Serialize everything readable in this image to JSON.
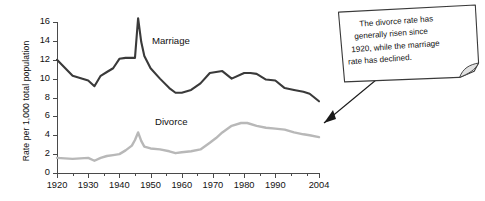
{
  "chart_data": {
    "type": "line",
    "title": "",
    "xlabel": "",
    "ylabel": "Rate per 1,000 total population",
    "xlim": [
      1920,
      2004
    ],
    "ylim": [
      0,
      16
    ],
    "grid": false,
    "legend": "inline-series-labels",
    "y_ticks": [
      0,
      2,
      4,
      6,
      8,
      10,
      12,
      14,
      16
    ],
    "y_tick_labels": [
      "0",
      "2",
      "4",
      "6",
      "8",
      "10",
      "12",
      "14",
      "16"
    ],
    "x_tick_labels": [
      "1920",
      "1930",
      "1940",
      "1950",
      "1960",
      "1970",
      "1980",
      "1990",
      "2004"
    ],
    "x_major_ticks": [
      1920,
      1930,
      1940,
      1950,
      1960,
      1970,
      1980,
      1990,
      2004
    ],
    "x_minor_ticks": [
      1925,
      1935,
      1945,
      1955,
      1965,
      1975,
      1985,
      1995,
      2000
    ],
    "series": [
      {
        "name": "Marriage",
        "color": "#3a3a3a",
        "label_text": "Marriage",
        "x": [
          1920,
          1925,
          1930,
          1932,
          1934,
          1936,
          1938,
          1940,
          1942,
          1944,
          1945,
          1946,
          1947,
          1948,
          1950,
          1953,
          1956,
          1958,
          1960,
          1963,
          1966,
          1969,
          1971,
          1973,
          1976,
          1980,
          1982,
          1984,
          1987,
          1990,
          1993,
          1996,
          1999,
          2001,
          2004
        ],
        "values": [
          12.0,
          10.3,
          9.8,
          9.2,
          10.3,
          10.7,
          11.1,
          12.1,
          12.2,
          12.2,
          12.2,
          16.4,
          13.9,
          12.4,
          11.1,
          10.0,
          9.0,
          8.5,
          8.5,
          8.8,
          9.5,
          10.6,
          10.7,
          10.8,
          10.0,
          10.6,
          10.6,
          10.5,
          9.9,
          9.8,
          9.0,
          8.8,
          8.6,
          8.4,
          7.6
        ]
      },
      {
        "name": "Divorce",
        "color": "#b8b8b8",
        "label_text": "Divorce",
        "x": [
          1920,
          1925,
          1930,
          1932,
          1934,
          1936,
          1938,
          1940,
          1942,
          1944,
          1945,
          1946,
          1947,
          1948,
          1950,
          1953,
          1956,
          1958,
          1960,
          1963,
          1966,
          1969,
          1971,
          1973,
          1976,
          1979,
          1981,
          1984,
          1987,
          1990,
          1993,
          1996,
          1999,
          2001,
          2004
        ],
        "values": [
          1.6,
          1.5,
          1.6,
          1.3,
          1.6,
          1.8,
          1.9,
          2.0,
          2.4,
          2.9,
          3.5,
          4.3,
          3.4,
          2.8,
          2.6,
          2.5,
          2.3,
          2.1,
          2.2,
          2.3,
          2.5,
          3.2,
          3.7,
          4.3,
          5.0,
          5.3,
          5.3,
          5.0,
          4.8,
          4.7,
          4.6,
          4.3,
          4.1,
          4.0,
          3.8
        ]
      }
    ],
    "annotation": {
      "name": "callout-note",
      "lines": [
        "The divorce rate has",
        "generally risen since",
        "1920, while the marriage",
        "rate has declined."
      ],
      "full_text": "The divorce rate has generally risen since 1920, while the marriage rate has declined.",
      "points_to": "divorce-series-endpoint-2004"
    }
  }
}
